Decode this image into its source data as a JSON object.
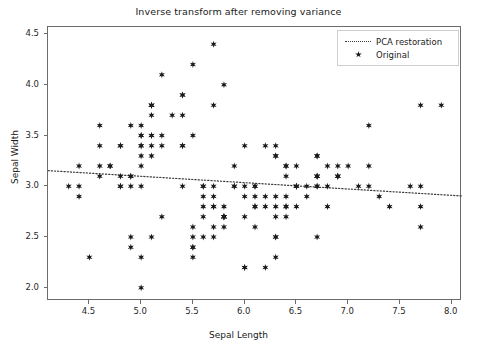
{
  "chart_data": {
    "type": "scatter",
    "title": "Inverse transform after removing variance",
    "xlabel": "Sepal Length",
    "ylabel": "Sepal Width",
    "xlim": [
      4.1,
      8.1
    ],
    "ylim": [
      1.87,
      4.57
    ],
    "xticks": [
      4.5,
      5.0,
      5.5,
      6.0,
      6.5,
      7.0,
      7.5,
      8.0
    ],
    "xticklabels": [
      "4.5",
      "5.0",
      "5.5",
      "6.0",
      "6.5",
      "7.0",
      "7.5",
      "8.0"
    ],
    "yticks": [
      2.0,
      2.5,
      3.0,
      3.5,
      4.0,
      4.5
    ],
    "yticklabels": [
      "2.0",
      "2.5",
      "3.0",
      "3.5",
      "4.0",
      "4.5"
    ],
    "grid": false,
    "legend_position": "upper right",
    "series": [
      {
        "name": "PCA restoration",
        "type": "line",
        "linestyle": "dotted",
        "color": "#3a3a3a",
        "x": [
          4.1,
          8.1
        ],
        "y": [
          3.155,
          2.905
        ]
      },
      {
        "name": "Original",
        "type": "scatter",
        "marker": "star",
        "color": "#1a1a1a",
        "points": [
          [
            5.1,
            3.5
          ],
          [
            4.9,
            3.0
          ],
          [
            4.7,
            3.2
          ],
          [
            4.6,
            3.1
          ],
          [
            5.0,
            3.6
          ],
          [
            5.4,
            3.9
          ],
          [
            4.6,
            3.4
          ],
          [
            5.0,
            3.4
          ],
          [
            4.4,
            2.9
          ],
          [
            4.9,
            3.1
          ],
          [
            5.4,
            3.7
          ],
          [
            4.8,
            3.4
          ],
          [
            4.8,
            3.0
          ],
          [
            4.3,
            3.0
          ],
          [
            5.8,
            4.0
          ],
          [
            5.7,
            4.4
          ],
          [
            5.4,
            3.9
          ],
          [
            5.1,
            3.5
          ],
          [
            5.7,
            3.8
          ],
          [
            5.1,
            3.8
          ],
          [
            5.4,
            3.4
          ],
          [
            5.1,
            3.7
          ],
          [
            4.6,
            3.6
          ],
          [
            5.1,
            3.3
          ],
          [
            4.8,
            3.4
          ],
          [
            5.0,
            3.0
          ],
          [
            5.0,
            3.4
          ],
          [
            5.2,
            3.5
          ],
          [
            5.2,
            3.4
          ],
          [
            4.7,
            3.2
          ],
          [
            4.8,
            3.1
          ],
          [
            5.4,
            3.4
          ],
          [
            5.2,
            4.1
          ],
          [
            5.5,
            4.2
          ],
          [
            4.9,
            3.1
          ],
          [
            5.0,
            3.2
          ],
          [
            5.5,
            3.5
          ],
          [
            4.9,
            3.6
          ],
          [
            4.4,
            3.0
          ],
          [
            5.1,
            3.4
          ],
          [
            5.0,
            3.5
          ],
          [
            4.5,
            2.3
          ],
          [
            4.4,
            3.2
          ],
          [
            5.0,
            3.5
          ],
          [
            5.1,
            3.8
          ],
          [
            4.8,
            3.0
          ],
          [
            5.1,
            3.8
          ],
          [
            4.6,
            3.2
          ],
          [
            5.3,
            3.7
          ],
          [
            5.0,
            3.3
          ],
          [
            7.0,
            3.2
          ],
          [
            6.4,
            3.2
          ],
          [
            6.9,
            3.1
          ],
          [
            5.5,
            2.3
          ],
          [
            6.5,
            2.8
          ],
          [
            5.7,
            2.8
          ],
          [
            6.3,
            3.3
          ],
          [
            4.9,
            2.4
          ],
          [
            6.6,
            2.9
          ],
          [
            5.2,
            2.7
          ],
          [
            5.0,
            2.0
          ],
          [
            5.9,
            3.0
          ],
          [
            6.0,
            2.2
          ],
          [
            6.1,
            2.9
          ],
          [
            5.6,
            2.9
          ],
          [
            6.7,
            3.1
          ],
          [
            5.6,
            3.0
          ],
          [
            5.8,
            2.7
          ],
          [
            6.2,
            2.2
          ],
          [
            5.6,
            2.5
          ],
          [
            5.9,
            3.2
          ],
          [
            6.1,
            2.8
          ],
          [
            6.3,
            2.5
          ],
          [
            6.1,
            2.8
          ],
          [
            6.4,
            2.9
          ],
          [
            6.6,
            3.0
          ],
          [
            6.8,
            2.8
          ],
          [
            6.7,
            3.0
          ],
          [
            6.0,
            2.9
          ],
          [
            5.7,
            2.6
          ],
          [
            5.5,
            2.4
          ],
          [
            5.5,
            2.4
          ],
          [
            5.8,
            2.7
          ],
          [
            6.0,
            2.7
          ],
          [
            5.4,
            3.0
          ],
          [
            6.0,
            3.4
          ],
          [
            6.7,
            3.1
          ],
          [
            6.3,
            2.3
          ],
          [
            5.6,
            3.0
          ],
          [
            5.5,
            2.5
          ],
          [
            5.5,
            2.6
          ],
          [
            6.1,
            3.0
          ],
          [
            5.8,
            2.6
          ],
          [
            5.0,
            2.3
          ],
          [
            5.6,
            2.7
          ],
          [
            5.7,
            3.0
          ],
          [
            5.7,
            2.9
          ],
          [
            6.2,
            2.9
          ],
          [
            5.1,
            2.5
          ],
          [
            5.7,
            2.8
          ],
          [
            6.3,
            3.3
          ],
          [
            5.8,
            2.7
          ],
          [
            7.1,
            3.0
          ],
          [
            6.3,
            2.9
          ],
          [
            6.5,
            3.0
          ],
          [
            7.6,
            3.0
          ],
          [
            4.9,
            2.5
          ],
          [
            7.3,
            2.9
          ],
          [
            6.7,
            2.5
          ],
          [
            7.2,
            3.6
          ],
          [
            6.5,
            3.2
          ],
          [
            6.4,
            2.7
          ],
          [
            6.8,
            3.0
          ],
          [
            5.7,
            2.5
          ],
          [
            5.8,
            2.8
          ],
          [
            6.4,
            3.2
          ],
          [
            6.5,
            3.0
          ],
          [
            7.7,
            3.8
          ],
          [
            7.7,
            2.6
          ],
          [
            6.0,
            2.2
          ],
          [
            6.9,
            3.2
          ],
          [
            5.6,
            2.8
          ],
          [
            7.7,
            2.8
          ],
          [
            6.3,
            2.7
          ],
          [
            6.7,
            3.3
          ],
          [
            7.2,
            3.2
          ],
          [
            6.2,
            2.8
          ],
          [
            6.1,
            3.0
          ],
          [
            6.4,
            2.8
          ],
          [
            7.2,
            3.0
          ],
          [
            7.4,
            2.8
          ],
          [
            7.9,
            3.8
          ],
          [
            6.4,
            2.8
          ],
          [
            6.3,
            2.8
          ],
          [
            6.1,
            2.6
          ],
          [
            7.7,
            3.0
          ],
          [
            6.3,
            3.4
          ],
          [
            6.4,
            3.1
          ],
          [
            6.0,
            3.0
          ],
          [
            6.9,
            3.1
          ],
          [
            6.7,
            3.1
          ],
          [
            6.9,
            3.1
          ],
          [
            5.8,
            2.7
          ],
          [
            6.8,
            3.2
          ],
          [
            6.7,
            3.3
          ],
          [
            6.7,
            3.0
          ],
          [
            6.3,
            2.5
          ],
          [
            6.5,
            3.0
          ],
          [
            6.2,
            3.4
          ],
          [
            5.9,
            3.0
          ]
        ]
      }
    ]
  },
  "legend": {
    "entries": [
      {
        "label": "PCA restoration"
      },
      {
        "label": "Original"
      }
    ]
  }
}
